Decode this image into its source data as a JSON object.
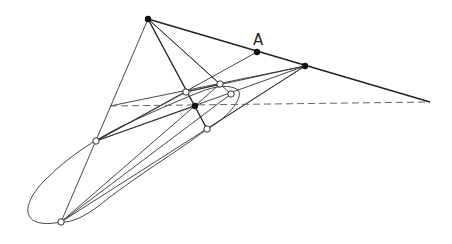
{
  "diagram": {
    "type": "projective-geometry-construction",
    "label_A": "A",
    "colors": {
      "line": "#333333",
      "dash": "#666666",
      "point": "#111111",
      "background": "#ffffff"
    },
    "points": {
      "P": [
        148,
        19
      ],
      "A": [
        257,
        52
      ],
      "Q": [
        305,
        66
      ],
      "R": [
        430,
        102
      ],
      "C": [
        195,
        106
      ],
      "O1": [
        186,
        92
      ],
      "O2": [
        220,
        84
      ],
      "O3": [
        231,
        94
      ],
      "O4": [
        207,
        129
      ],
      "O5": [
        96,
        141
      ],
      "O6": [
        61,
        222
      ],
      "D0": [
        110,
        106
      ]
    },
    "filled_points": [
      "P",
      "A",
      "Q",
      "C"
    ],
    "open_points": [
      "O1",
      "O2",
      "O3",
      "O4",
      "O5",
      "O6"
    ],
    "thick_lines": [
      [
        "P",
        "R"
      ],
      [
        "P",
        "O4"
      ]
    ],
    "lines": [
      [
        "P",
        "O6"
      ],
      [
        "P",
        "O2"
      ],
      [
        "P",
        "O3"
      ],
      [
        "A",
        "O5"
      ],
      [
        "Q",
        "O5"
      ],
      [
        "Q",
        "O1"
      ],
      [
        "Q",
        "D0"
      ],
      [
        "Q",
        "O6"
      ],
      [
        "Q",
        "O4"
      ],
      [
        "O6",
        "O2"
      ],
      [
        "O6",
        "O3"
      ],
      [
        "O5",
        "O1"
      ],
      [
        "O1",
        "O2"
      ],
      [
        "C",
        "O5"
      ]
    ],
    "dashed_lines": [
      [
        "D0",
        "R"
      ]
    ]
  }
}
